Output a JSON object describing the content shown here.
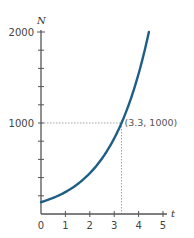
{
  "chart_data": {
    "type": "line",
    "title": "",
    "xlabel": "t",
    "ylabel": "N",
    "xlim": [
      0,
      5
    ],
    "ylim": [
      0,
      2000
    ],
    "x_ticks": [
      0,
      1,
      2,
      3,
      4,
      5
    ],
    "x_tick_labels": [
      "0",
      "1",
      "2",
      "3",
      "4",
      "5"
    ],
    "y_major_ticks": [
      1000,
      2000
    ],
    "y_tick_labels": [
      "1000",
      "2000"
    ],
    "y_minor_tick_step": 200,
    "grid": false,
    "series": [
      {
        "name": "N(t)",
        "color": "#1f5f86",
        "model": "exponential",
        "initial_value": 130,
        "passes_through": [
          3.3,
          1000
        ],
        "x": [
          0,
          0.5,
          1,
          1.5,
          2,
          2.5,
          3,
          3.3,
          3.5,
          4,
          4.42
        ],
        "values": [
          130,
          177,
          241,
          329,
          448,
          611,
          833,
          1000,
          1133,
          1544,
          2000
        ]
      }
    ],
    "annotations": [
      {
        "text": "(3.3, 1000)",
        "point": [
          3.3,
          1000
        ],
        "guide_lines": "dotted"
      }
    ]
  }
}
